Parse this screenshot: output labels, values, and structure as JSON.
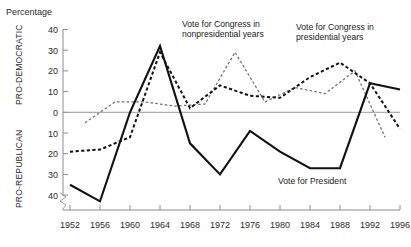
{
  "chart_data": {
    "type": "line",
    "title": "Percentage",
    "xlabel": "",
    "ylabel": "Percentage",
    "grid": false,
    "legend_position": "inline-annotations",
    "axis_break": true,
    "xlim": [
      1952,
      1996
    ],
    "ylim": [
      -45,
      40
    ],
    "y_axis_note": "Values above zero are PRO-DEMOCRATIC; values below zero are PRO-REPUBLICAN (tick labels shown unsigned)",
    "x_ticks": [
      1952,
      1956,
      1960,
      1964,
      1968,
      1972,
      1976,
      1980,
      1984,
      1988,
      1992,
      1996
    ],
    "x_tick_labels": [
      "1952",
      "1956",
      "1960",
      "1964",
      "1968",
      "1972",
      "1976",
      "1980",
      "1984",
      "1988",
      "1992",
      "1996"
    ],
    "y_ticks": [
      40,
      30,
      20,
      10,
      0,
      -10,
      -20,
      -30,
      -40
    ],
    "y_tick_labels": [
      "40",
      "30",
      "20",
      "10",
      "0",
      "10",
      "20",
      "30",
      "40"
    ],
    "side_label_top": "PRO-DEMOCRATIC",
    "side_label_bottom": "PRO-REPUBLICAN",
    "series": [
      {
        "name": "Vote for President",
        "style": "solid",
        "color": "#111111",
        "x": [
          1952,
          1956,
          1960,
          1964,
          1968,
          1972,
          1976,
          1980,
          1984,
          1988,
          1992,
          1996
        ],
        "values": [
          -35,
          -43,
          0,
          32,
          -15,
          -30,
          -9,
          -19,
          -27,
          -27,
          14,
          11
        ]
      },
      {
        "name": "Vote for Congress in presidential years",
        "style": "dashed-bold",
        "color": "#111111",
        "x": [
          1952,
          1956,
          1960,
          1964,
          1968,
          1972,
          1976,
          1980,
          1984,
          1988,
          1992,
          1996
        ],
        "values": [
          -19,
          -18,
          -12,
          29,
          2,
          13,
          8,
          7,
          17,
          24,
          14,
          -8
        ]
      },
      {
        "name": "Vote for Congress in nonpresidential years",
        "style": "dashed-thin",
        "color": "#6f6f6f",
        "x": [
          1954,
          1958,
          1962,
          1966,
          1970,
          1974,
          1978,
          1982,
          1986,
          1990,
          1994
        ],
        "values": [
          -5,
          5,
          5,
          3,
          4,
          29,
          5,
          12,
          9,
          20,
          -12
        ]
      }
    ],
    "annotations": [
      {
        "text_line1": "Vote for Congress in",
        "text_line2": "nonpresidential years"
      },
      {
        "text_line1": "Vote for Congress in",
        "text_line2": "presidential years"
      },
      {
        "text_line1": "Vote for President",
        "text_line2": ""
      }
    ]
  },
  "labels": {
    "chart_title": "Percentage",
    "side_top": "PRO-DEMOCRATIC",
    "side_bottom": "PRO-REPUBLICAN",
    "annot_nonpres_l1": "Vote for Congress in",
    "annot_nonpres_l2": "nonpresidential years",
    "annot_pres_l1": "Vote for Congress in",
    "annot_pres_l2": "presidential years",
    "annot_president": "Vote for President",
    "y40a": "40",
    "y30a": "30",
    "y20a": "20",
    "y10a": "10",
    "y0": "0",
    "y10b": "10",
    "y20b": "20",
    "y30b": "30",
    "y40b": "40",
    "x1952": "1952",
    "x1956": "1956",
    "x1960": "1960",
    "x1964": "1964",
    "x1968": "1968",
    "x1972": "1972",
    "x1976": "1976",
    "x1980": "1980",
    "x1984": "1984",
    "x1988": "1988",
    "x1992": "1992",
    "x1996": "1996"
  }
}
